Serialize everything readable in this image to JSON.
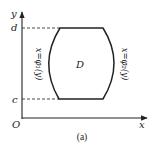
{
  "diagram": {
    "axes": {
      "x_label": "x",
      "y_label": "y",
      "origin_label": "O"
    },
    "levels": {
      "upper": "d",
      "lower": "c"
    },
    "region": {
      "label": "D",
      "left_boundary": "x=φ₁(y)",
      "right_boundary": "x=φ₂(y)"
    },
    "caption": "(a)",
    "colors": {
      "stroke": "#222222",
      "background": "#ffffff"
    }
  }
}
